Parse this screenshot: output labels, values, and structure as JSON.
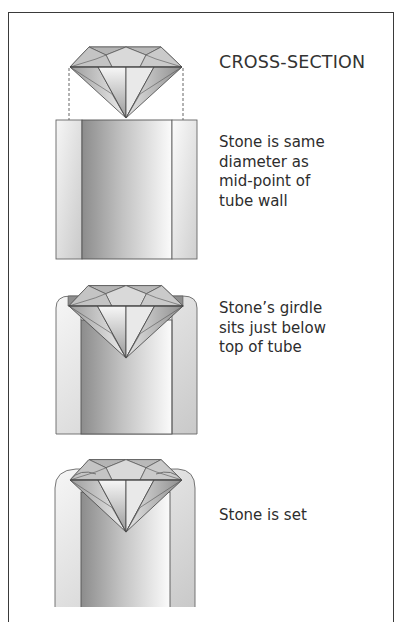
{
  "figure": {
    "title": "CROSS-SECTION",
    "stages": [
      {
        "name": "stone-above-tube",
        "caption_lines": [
          "Stone is same",
          "diameter as",
          "mid-point of",
          "tube wall"
        ]
      },
      {
        "name": "stone-seated",
        "caption_lines": [
          "Stone’s girdle",
          "sits just below",
          "top of tube"
        ]
      },
      {
        "name": "stone-set",
        "caption_lines": [
          "Stone is set"
        ]
      }
    ],
    "colors": {
      "frame": "#3a3a3a",
      "line": "#555555",
      "tube_dark": "#8a8a8a",
      "tube_light": "#f4f4f4"
    }
  }
}
